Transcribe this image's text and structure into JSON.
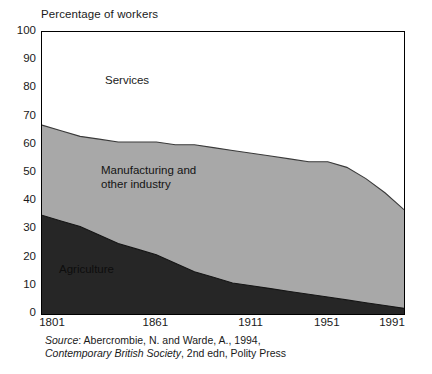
{
  "chart_data": {
    "type": "area",
    "title": "",
    "subtitle": "",
    "ylabel": "Percentage of workers",
    "xlabel": "",
    "stacked": true,
    "grid": false,
    "legend_position": "inline-labels",
    "xlim": [
      1801,
      1991
    ],
    "ylim": [
      0,
      100
    ],
    "y_ticks": [
      0,
      10,
      20,
      30,
      40,
      50,
      60,
      70,
      80,
      90,
      100
    ],
    "x_ticks": [
      1801,
      1861,
      1911,
      1951,
      1991
    ],
    "x": [
      1801,
      1811,
      1821,
      1831,
      1841,
      1851,
      1861,
      1871,
      1881,
      1891,
      1901,
      1911,
      1921,
      1931,
      1941,
      1951,
      1961,
      1971,
      1981,
      1991
    ],
    "series": [
      {
        "name": "Agriculture",
        "color": "#262626",
        "values": [
          35,
          33,
          31,
          28,
          25,
          23,
          21,
          18,
          15,
          13,
          11,
          10,
          9,
          8,
          7,
          6,
          5,
          4,
          3,
          2
        ]
      },
      {
        "name": "Manufacturing and other industry",
        "color": "#a8a8a8",
        "values": [
          32,
          32,
          32,
          34,
          36,
          38,
          40,
          42,
          45,
          46,
          47,
          47,
          47,
          47,
          47,
          48,
          47,
          44,
          40,
          35
        ]
      },
      {
        "name": "Services",
        "color": "#ffffff",
        "values": [
          33,
          35,
          37,
          38,
          39,
          39,
          39,
          40,
          40,
          41,
          42,
          43,
          44,
          45,
          46,
          46,
          48,
          52,
          57,
          63
        ]
      }
    ],
    "cumulative_top_of_agriculture": [
      35,
      33,
      31,
      28,
      25,
      23,
      21,
      18,
      15,
      13,
      11,
      10,
      9,
      8,
      7,
      6,
      5,
      4,
      3,
      2
    ],
    "cumulative_top_of_manufacturing": [
      67,
      65,
      63,
      62,
      61,
      61,
      61,
      60,
      60,
      59,
      58,
      57,
      56,
      55,
      54,
      54,
      52,
      48,
      43,
      37
    ]
  },
  "axes": {
    "y_title": "Percentage of workers",
    "y_tick_labels": [
      "100",
      "90",
      "80",
      "70",
      "60",
      "50",
      "40",
      "30",
      "20",
      "10",
      "0"
    ],
    "x_tick_labels": [
      "1801",
      "1861",
      "1911",
      "1951",
      "1991"
    ]
  },
  "series_labels": {
    "services": "Services",
    "manufacturing": "Manufacturing and\nother industry",
    "agriculture": "Agriculture"
  },
  "source": {
    "label": "Source",
    "separator": ": ",
    "authors": "Abercrombie, N. and Warde, A., 1994,",
    "title": "Contemporary British Society",
    "publication": ", 2nd edn, Polity Press"
  },
  "colors": {
    "agriculture": "#262626",
    "manufacturing": "#a8a8a8",
    "services": "#ffffff",
    "axis": "#000000",
    "text": "#1a1a1a"
  }
}
